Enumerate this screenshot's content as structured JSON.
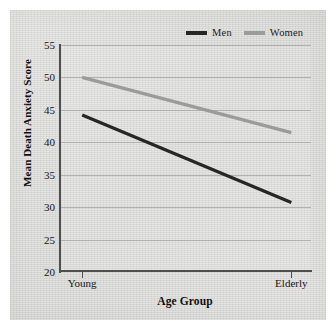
{
  "figure": {
    "background_color": "#d9d9d7",
    "page_color": "#ffffff"
  },
  "legend": {
    "position": "top-right",
    "entries": [
      {
        "label": "Men",
        "color": "#262626",
        "icon": "line-swatch-icon"
      },
      {
        "label": "Women",
        "color": "#9b9b9b",
        "icon": "line-swatch-icon"
      }
    ]
  },
  "chart_data": {
    "type": "line",
    "title": "",
    "subtitle": "",
    "xlabel": "Age Group",
    "ylabel": "Mean Death Anxiety Score",
    "categories": [
      "Young",
      "Elderly"
    ],
    "x": [
      0,
      1
    ],
    "ylim": [
      20,
      55
    ],
    "yticks": [
      20,
      25,
      30,
      35,
      40,
      45,
      50,
      55
    ],
    "ytick_labels": [
      "20",
      "25",
      "30",
      "35",
      "40",
      "45",
      "50",
      "55"
    ],
    "grid": true,
    "grid_axis": "y",
    "legend_position": "top-right",
    "series": [
      {
        "name": "Men",
        "values": [
          44.2,
          30.7
        ],
        "color": "#262626",
        "width": 3.2
      },
      {
        "name": "Women",
        "values": [
          50.0,
          41.5
        ],
        "color": "#9b9b9b",
        "width": 3.2
      }
    ]
  }
}
